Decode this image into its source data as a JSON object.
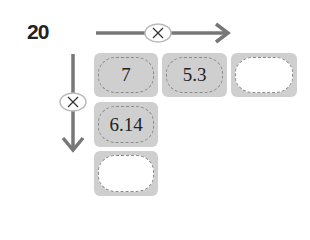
{
  "problem": {
    "number": "20"
  },
  "operators": {
    "horizontal": "×",
    "vertical": "×"
  },
  "boxes": {
    "row_a": "7",
    "row_b": "5.3",
    "row_c": "",
    "col_b": "6.14",
    "col_c": ""
  },
  "colors": {
    "arrow": "#777777",
    "box_fill": "#cfcfcf",
    "dash": "#8a8a8a"
  }
}
